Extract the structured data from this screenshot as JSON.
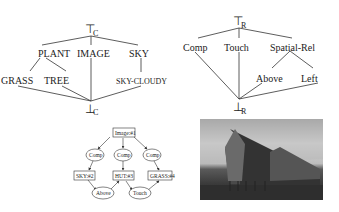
{
  "left_lattice": {
    "top": {
      "symbol": "⊤",
      "sub": "C"
    },
    "bottom": {
      "symbol": "⊥",
      "sub": "C"
    },
    "level1": [
      "PLANT",
      "IMAGE",
      "SKY"
    ],
    "level2": [
      "GRASS",
      "TREE",
      "SKY-CLOUDY"
    ]
  },
  "right_lattice": {
    "top": {
      "symbol": "⊤",
      "sub": "R"
    },
    "bottom": {
      "symbol": "⊥",
      "sub": "R"
    },
    "level1": [
      "Comp",
      "Touch",
      "Spatial-Rel"
    ],
    "level2": [
      "Above",
      "Left"
    ]
  },
  "graph": {
    "root": "Image:#1",
    "relations": [
      "Comp",
      "Comp",
      "Comp"
    ],
    "objects": [
      "SKY:#2",
      "HUT:#3",
      "GRASS:#4"
    ],
    "spatial": [
      "Above",
      "Touch"
    ]
  },
  "photo": {
    "description": "grayscale photo of huts on stilts"
  }
}
